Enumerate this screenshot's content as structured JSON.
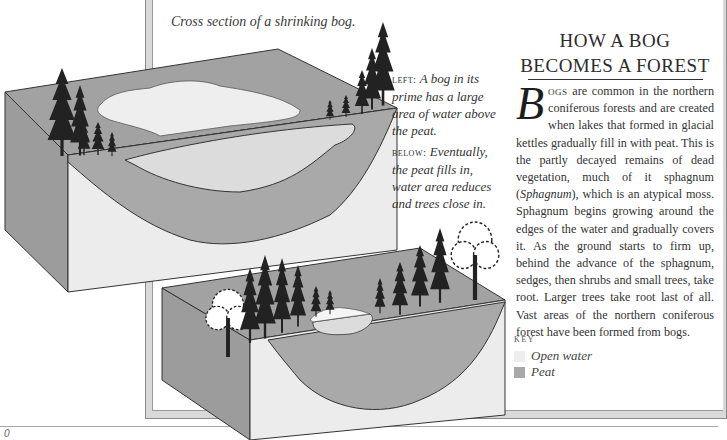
{
  "figure": {
    "caption": "Cross section of a shrinking bog.",
    "annotations": [
      {
        "lead": "left:",
        "text": "A bog in its prime has a large area of water above the peat."
      },
      {
        "lead": "below:",
        "text": "Eventually, the peat fills in, water area reduces and trees close in."
      }
    ],
    "colors": {
      "open_water": "#eeeeee",
      "peat": "#a9a9a9",
      "surface": "#a2a2a2",
      "soil": "#ececec",
      "side": "#9c9c9c",
      "outline": "#333333"
    }
  },
  "article": {
    "heading_line1": "HOW A BOG",
    "heading_line2": "BECOMES A FOREST",
    "dropcap": "B",
    "lead_smallcaps": "ogs",
    "body_part1": " are common in the northern coniferous forests and are created when lakes that formed in glacial kettles gradually fill in with peat. This is the partly decayed remains of dead vege­tation, much of it sphagnum (",
    "italic_term": "Sphag­num",
    "body_part2": "), which is an atypical moss. Sphag­num begins growing around the edges of the water and gradually covers it. As the ground starts to firm up, behind the advance of the sphagnum, sedges, then shrubs and small trees, take root. Larger trees take root last of all. Vast areas of the northern coniferous forest have been formed from bogs."
  },
  "key": {
    "label": "KEY",
    "items": [
      {
        "label": "Open water",
        "color": "#eeeeee"
      },
      {
        "label": "Peat",
        "color": "#a9a9a9"
      }
    ]
  },
  "page": {
    "number": "0"
  }
}
